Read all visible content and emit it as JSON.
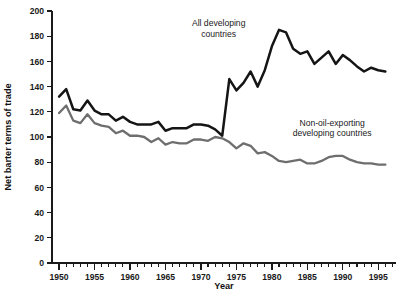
{
  "chart_data": {
    "type": "line",
    "title": "",
    "xlabel": "Year",
    "ylabel": "Net barter terms of trade",
    "xlim": [
      1949,
      1997.5
    ],
    "ylim": [
      0,
      200
    ],
    "grid": false,
    "legend_position": "inline-annotations",
    "x_ticks_major": [
      1950,
      1955,
      1960,
      1965,
      1970,
      1975,
      1980,
      1985,
      1990,
      1995
    ],
    "x_tick_labels": [
      "1950",
      "1955",
      "1960",
      "1965",
      "1970",
      "1975",
      "1980",
      "1985",
      "1990",
      "1995"
    ],
    "x_minor_step": 1,
    "y_ticks": [
      0,
      20,
      40,
      60,
      80,
      100,
      120,
      140,
      160,
      180,
      200
    ],
    "y_tick_labels": [
      "0",
      "20",
      "40",
      "60",
      "80",
      "100",
      "120",
      "140",
      "160",
      "180",
      "200"
    ],
    "x": [
      1950,
      1951,
      1952,
      1953,
      1954,
      1955,
      1956,
      1957,
      1958,
      1959,
      1960,
      1961,
      1962,
      1963,
      1964,
      1965,
      1966,
      1967,
      1968,
      1969,
      1970,
      1971,
      1972,
      1973,
      1974,
      1975,
      1976,
      1977,
      1978,
      1979,
      1980,
      1981,
      1982,
      1983,
      1984,
      1985,
      1986,
      1987,
      1988,
      1989,
      1990,
      1991,
      1992,
      1993,
      1994,
      1995,
      1996
    ],
    "series": [
      {
        "name": "All developing countries",
        "color": "#151515",
        "values": [
          132,
          138,
          122,
          121,
          129,
          121,
          118,
          118,
          113,
          116,
          112,
          110,
          110,
          110,
          112,
          105,
          107,
          107,
          107,
          110,
          110,
          109,
          106,
          101,
          146,
          137,
          143,
          152,
          140,
          153,
          172,
          185,
          183,
          170,
          166,
          168,
          158,
          163,
          168,
          158,
          165,
          161,
          156,
          152,
          155,
          153,
          152
        ]
      },
      {
        "name": "Non-oil-exporting developing countries",
        "color": "#6e6e6e",
        "values": [
          119,
          125,
          113,
          111,
          118,
          111,
          109,
          108,
          103,
          105,
          101,
          101,
          100,
          96,
          99,
          94,
          96,
          95,
          95,
          98,
          98,
          97,
          100,
          99,
          96,
          91,
          95,
          93,
          87,
          88,
          85,
          81,
          80,
          81,
          82,
          79,
          79,
          81,
          84,
          85,
          85,
          82,
          80,
          79,
          79,
          78,
          78
        ]
      }
    ],
    "annotations": [
      {
        "name": "all-developing-countries-label",
        "lines": [
          "All developing",
          "countries"
        ],
        "x": 1972.5,
        "y": 188
      },
      {
        "name": "non-oil-exporting-label",
        "lines": [
          "Non-oil-exporting",
          "developing countries"
        ],
        "x": 1988.5,
        "y": 109
      }
    ]
  }
}
